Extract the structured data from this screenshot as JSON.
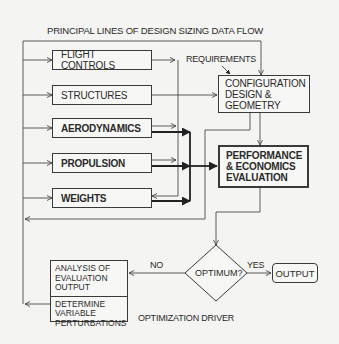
{
  "diagram": {
    "title": "PRINCIPAL LINES OF DESIGN SIZING DATA FLOW",
    "discipline_boxes": [
      {
        "id": "flight-controls",
        "label": "FLIGHT CONTROLS",
        "emphasis": "normal"
      },
      {
        "id": "structures",
        "label": "STRUCTURES",
        "emphasis": "normal"
      },
      {
        "id": "aerodynamics",
        "label": "AERODYNAMICS",
        "emphasis": "bold"
      },
      {
        "id": "propulsion",
        "label": "PROPULSION",
        "emphasis": "bold"
      },
      {
        "id": "weights",
        "label": "WEIGHTS",
        "emphasis": "bold"
      }
    ],
    "requirements_label": "REQUIREMENTS",
    "config_box": {
      "lines": [
        "CONFIGURATION",
        "DESIGN &",
        "GEOMETRY"
      ]
    },
    "performance_box": {
      "lines": [
        "PERFORMANCE",
        "& ECONOMICS",
        "EVALUATION"
      ]
    },
    "decision": {
      "label": "OPTIMUM?",
      "yes_label": "YES",
      "no_label": "NO"
    },
    "output_box": {
      "label": "OUTPUT"
    },
    "optimization_box": {
      "sections": [
        {
          "lines": [
            "ANALYSIS OF",
            "EVALUATION",
            "OUTPUT"
          ]
        },
        {
          "lines": [
            "DETERMINE",
            "VARIABLE",
            "PERTURBATIONS"
          ]
        }
      ]
    },
    "optimization_label": "OPTIMIZATION DRIVER"
  }
}
